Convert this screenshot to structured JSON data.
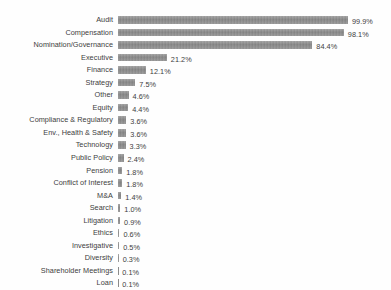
{
  "chart_data": {
    "type": "bar",
    "orientation": "horizontal",
    "title": "",
    "subtitle": "",
    "xlabel": "",
    "ylabel": "",
    "xlim": [
      0,
      100
    ],
    "grid": false,
    "legend": null,
    "value_suffix": "%",
    "bar_color": "#8b8b8b",
    "text_color": "#3d3d3d",
    "background_color": "#fefefe",
    "categories": [
      "Audit",
      "Compensation",
      "Nomination/Governance",
      "Executive",
      "Finance",
      "Strategy",
      "Other",
      "Equity",
      "Compliance & Regulatory",
      "Env., Health & Safety",
      "Technology",
      "Public Policy",
      "Pension",
      "Conflict of Interest",
      "M&A",
      "Search",
      "Litigation",
      "Ethics",
      "Investigative",
      "Diversity",
      "Shareholder Meetings",
      "Loan"
    ],
    "values": [
      99.9,
      98.1,
      84.4,
      21.2,
      12.1,
      7.5,
      4.6,
      4.4,
      3.6,
      3.6,
      3.3,
      2.4,
      1.8,
      1.8,
      1.4,
      1.0,
      0.9,
      0.6,
      0.5,
      0.3,
      0.1,
      0.1
    ],
    "value_labels": [
      "99.9%",
      "98.1%",
      "84.4%",
      "21.2%",
      "12.1%",
      "7.5%",
      "4.6%",
      "4.4%",
      "3.6%",
      "3.6%",
      "3.3%",
      "2.4%",
      "1.8%",
      "1.8%",
      "1.4%",
      "1.0%",
      "0.9%",
      "0.6%",
      "0.5%",
      "0.3%",
      "0.1%",
      "0.1%"
    ]
  }
}
